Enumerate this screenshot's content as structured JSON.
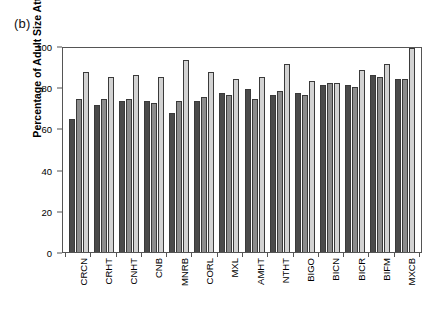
{
  "figure": {
    "panel_label": "(b)"
  },
  "chart_data": {
    "type": "bar",
    "title": "",
    "xlabel": "",
    "ylabel": "Percentage of Adult Size Attained",
    "ylim": [
      0,
      100
    ],
    "yticks": [
      0,
      20,
      40,
      60,
      80,
      100
    ],
    "grid": false,
    "legend_position": "none",
    "colors": {
      "series1": "#4a4a4a",
      "series2": "#8c8c8c",
      "series3": "#d2d2d2",
      "axis": "#555555",
      "background": "#ffffff"
    },
    "categories": [
      "CRCN",
      "CRHT",
      "CNHT",
      "CNB",
      "MNRB",
      "CORL",
      "MXL",
      "AMHT",
      "NTHT",
      "BIGO",
      "BICN",
      "BICR",
      "BIFM",
      "MXCB"
    ],
    "series": [
      {
        "name": "series1",
        "values": [
          65,
          72,
          74,
          74,
          68,
          74,
          78,
          80,
          77,
          78,
          82,
          82,
          87,
          85
        ]
      },
      {
        "name": "series2",
        "values": [
          75,
          75,
          75,
          73,
          74,
          76,
          77,
          75,
          79,
          77,
          83,
          81,
          86,
          85
        ]
      },
      {
        "name": "series3",
        "values": [
          88,
          86,
          87,
          86,
          94,
          88,
          85,
          86,
          92,
          84,
          83,
          89,
          92,
          100
        ]
      }
    ]
  }
}
